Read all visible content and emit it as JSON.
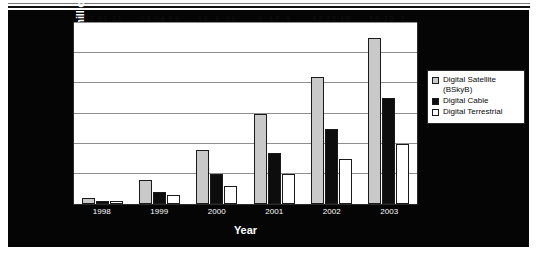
{
  "chart_data": {
    "type": "bar",
    "title": "",
    "xlabel": "Year",
    "ylabel": "Number of households (millions)",
    "categories": [
      "1998",
      "1999",
      "2000",
      "2001",
      "2002",
      "2003"
    ],
    "ylim": [
      0,
      6
    ],
    "yticks": [
      0,
      1,
      2,
      3,
      4,
      5,
      6
    ],
    "grid": true,
    "legend_position": "right",
    "series": [
      {
        "name": "Digital Satellite (BSkyB)",
        "legend_label": "Digital Satellite\n(BSkyB)",
        "color": "#c9c9c9",
        "values": [
          0.2,
          0.8,
          1.8,
          3,
          4.2,
          5.5
        ],
        "labels": [
          "0.2",
          "0.8",
          "1.8",
          "3",
          "4.2",
          "5.5"
        ]
      },
      {
        "name": "Digital Cable",
        "legend_label": "Digital Cable",
        "color": "#0d0d0d",
        "values": [
          0.1,
          0.4,
          1,
          1.7,
          2.5,
          3.5
        ],
        "labels": [
          "0.1",
          "0.4",
          "1",
          "1.7",
          "2.5",
          "3.5"
        ]
      },
      {
        "name": "Digital Terrestrial",
        "legend_label": "Digital Terrestrial",
        "color": "#ffffff",
        "values": [
          0.1,
          0.3,
          0.6,
          1,
          1.5,
          2
        ],
        "labels": [
          "0.1",
          "0.3",
          "0.6",
          "1",
          "1.5",
          "2"
        ]
      }
    ]
  },
  "axis": {
    "y_title": "Number of households (millions)",
    "x_title": "Year"
  }
}
